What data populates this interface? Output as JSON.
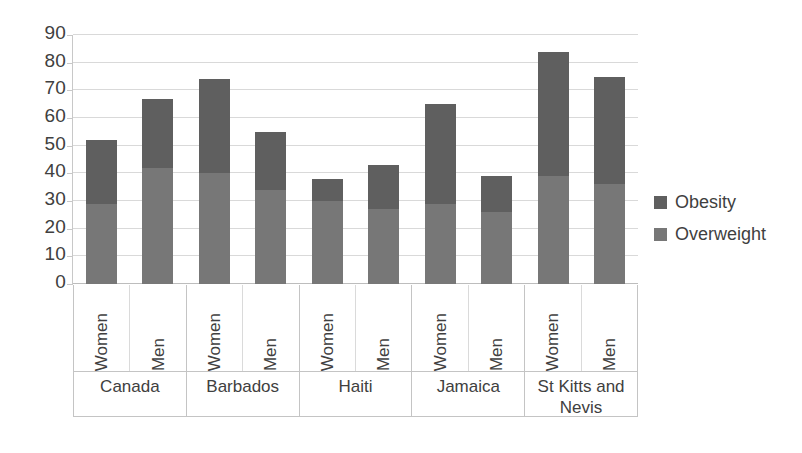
{
  "chart_data": {
    "type": "bar",
    "subtype": "stacked-bar",
    "title": "",
    "subtitle": "",
    "xlabel": "",
    "ylabel": "",
    "ylim": [
      0,
      90
    ],
    "y_ticks": [
      0,
      10,
      20,
      30,
      40,
      50,
      60,
      70,
      80,
      90
    ],
    "y_tick_labels": [
      "0",
      "10",
      "20",
      "30",
      "40",
      "50",
      "60",
      "70",
      "80",
      "90"
    ],
    "grid": true,
    "legend_position": "right",
    "legend": [
      "Obesity",
      "Overweight"
    ],
    "colors": {
      "obesity": "#5f5f5f",
      "overweight": "#777777",
      "gridline": "#d9d9d9",
      "axis": "#c4c4c4",
      "text": "#404040",
      "background": "#ffffff"
    },
    "groups": [
      "Canada",
      "Barbados",
      "Haiti",
      "Jamaica",
      "St Kitts and Nevis"
    ],
    "subcategories": [
      "Women",
      "Men"
    ],
    "categories": [
      "Canada / Women",
      "Canada / Men",
      "Barbados / Women",
      "Barbados / Men",
      "Haiti / Women",
      "Haiti / Men",
      "Jamaica / Women",
      "Jamaica / Men",
      "St Kitts and Nevis / Women",
      "St Kitts and Nevis / Men"
    ],
    "series": [
      {
        "name": "Overweight",
        "values": [
          29,
          42,
          40,
          34,
          30,
          27,
          29,
          26,
          39,
          36
        ]
      },
      {
        "name": "Obesity",
        "values": [
          23,
          25,
          34,
          21,
          8,
          16,
          36,
          13,
          45,
          39
        ]
      }
    ],
    "totals": [
      52,
      67,
      74,
      55,
      38,
      43,
      65,
      39,
      84,
      75
    ],
    "bars": [
      {
        "group": "Canada",
        "sub": "Women",
        "overweight": 29,
        "obesity": 23,
        "total": 52
      },
      {
        "group": "Canada",
        "sub": "Men",
        "overweight": 42,
        "obesity": 25,
        "total": 67
      },
      {
        "group": "Barbados",
        "sub": "Women",
        "overweight": 40,
        "obesity": 34,
        "total": 74
      },
      {
        "group": "Barbados",
        "sub": "Men",
        "overweight": 34,
        "obesity": 21,
        "total": 55
      },
      {
        "group": "Haiti",
        "sub": "Women",
        "overweight": 30,
        "obesity": 8,
        "total": 38
      },
      {
        "group": "Haiti",
        "sub": "Men",
        "overweight": 27,
        "obesity": 16,
        "total": 43
      },
      {
        "group": "Jamaica",
        "sub": "Women",
        "overweight": 29,
        "obesity": 36,
        "total": 65
      },
      {
        "group": "Jamaica",
        "sub": "Men",
        "overweight": 26,
        "obesity": 13,
        "total": 39
      },
      {
        "group": "St Kitts and Nevis",
        "sub": "Women",
        "overweight": 39,
        "obesity": 45,
        "total": 84
      },
      {
        "group": "St Kitts and Nevis",
        "sub": "Men",
        "overweight": 36,
        "obesity": 39,
        "total": 75
      }
    ]
  },
  "axis": {
    "y_tick_labels": [
      "90",
      "80",
      "70",
      "60",
      "50",
      "40",
      "30",
      "20",
      "10",
      "0"
    ]
  },
  "x_axis": {
    "sub_labels": [
      "Women",
      "Men",
      "Women",
      "Men",
      "Women",
      "Men",
      "Women",
      "Men",
      "Women",
      "Men"
    ],
    "group_labels": [
      "Canada",
      "Barbados",
      "Haiti",
      "Jamaica",
      "St Kitts and Nevis"
    ]
  },
  "legend": {
    "items": [
      {
        "label": "Obesity",
        "color": "#5f5f5f"
      },
      {
        "label": "Overweight",
        "color": "#777777"
      }
    ]
  }
}
